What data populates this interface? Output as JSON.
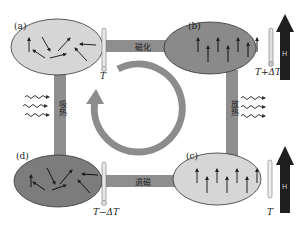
{
  "diagram": {
    "process_labels": {
      "top": "磁化",
      "right": "放热",
      "bottom": "退磁",
      "left": "吸热"
    },
    "panels": [
      {
        "id": "a",
        "label": "(a)",
        "state": "random magnetic moments",
        "fill": "#d6d6d6",
        "temperature": "T",
        "field": false
      },
      {
        "id": "b",
        "label": "(b)",
        "state": "aligned magnetic moments",
        "fill": "#8a8a8a",
        "temperature": "T+ΔT",
        "field": true
      },
      {
        "id": "c",
        "label": "(c)",
        "state": "aligned magnetic moments",
        "fill": "#d6d6d6",
        "temperature": "T",
        "field": true
      },
      {
        "id": "d",
        "label": "(d)",
        "state": "random magnetic moments",
        "fill": "#7c7c7c",
        "temperature": "T−ΔT",
        "field": false
      }
    ],
    "field_arrow_label": "H",
    "cycle_direction": "clockwise",
    "colors": {
      "bar": "#8e8e8e",
      "cycle_arrow": "#8c8c8c",
      "field_arrow": "#1e1e1e",
      "light_panel": "#d6d6d6",
      "dark_panel": "#848484"
    }
  }
}
